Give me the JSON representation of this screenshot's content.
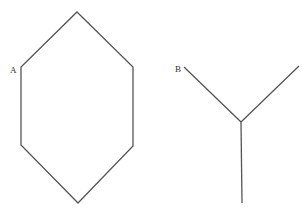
{
  "figure": {
    "shapes": [
      {
        "name": "hexagon",
        "label": "A",
        "points": [
          [
            77,
            12
          ],
          [
            133,
            67
          ],
          [
            133,
            146
          ],
          [
            78,
            203
          ],
          [
            21,
            145
          ],
          [
            21,
            67
          ]
        ]
      },
      {
        "name": "y-junction",
        "label": "B",
        "center": [
          241,
          122
        ],
        "ends": [
          [
            184,
            67
          ],
          [
            299,
            66
          ],
          [
            242,
            203
          ]
        ]
      }
    ],
    "stroke_color": "#555555"
  }
}
